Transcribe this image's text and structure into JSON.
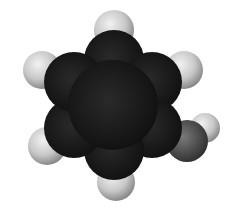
{
  "figure": {
    "atoms": [
      {
        "name": "carbon-ring",
        "cx": 112,
        "cy": 106,
        "r": 68,
        "color": "#1a1a1a"
      },
      {
        "name": "hydrogen-top",
        "cx": 114,
        "cy": 29,
        "r": 20,
        "color": "#cfcfcf"
      },
      {
        "name": "hydrogen-upper-right",
        "cx": 184,
        "cy": 70,
        "r": 19,
        "color": "#cfcfcf"
      },
      {
        "name": "hydrogen-upper-left",
        "cx": 42,
        "cy": 70,
        "r": 19,
        "color": "#cfcfcf"
      },
      {
        "name": "hydrogen-lower-left",
        "cx": 47,
        "cy": 146,
        "r": 19,
        "color": "#cfcfcf"
      },
      {
        "name": "hydrogen-bottom",
        "cx": 116,
        "cy": 182,
        "r": 19,
        "color": "#cfcfcf"
      },
      {
        "name": "hydrogen-hydroxyl",
        "cx": 205,
        "cy": 128,
        "r": 15,
        "color": "#d8d8d8"
      },
      {
        "name": "oxygen",
        "cx": 189,
        "cy": 140,
        "r": 21,
        "color": "#555555"
      }
    ]
  }
}
